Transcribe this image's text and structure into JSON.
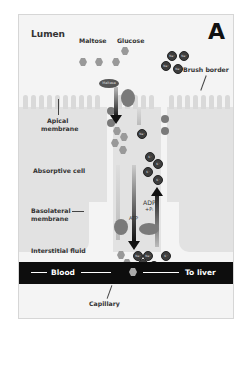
{
  "figure": {
    "panel_letter": "A",
    "labels": {
      "lumen": "Lumen",
      "maltose": "Maltose",
      "glucose": "Glucose",
      "brush_border": "Brush border",
      "apical_membrane_line1": "Apical",
      "apical_membrane_line2": "membrane",
      "absorptive_cell": "Absorptive cell",
      "basolateral_membrane_line1": "Basolateral",
      "basolateral_membrane_line2": "membrane",
      "interstitial_fluid": "Interstitial fluid",
      "capillary": "Capillary",
      "atp": "ATP",
      "adp": "ADP",
      "pi": "+Pᵢ",
      "maltose_enzyme": "Maltase"
    },
    "blood_bar": {
      "left_label": "Blood",
      "right_label": "To liver"
    },
    "ions": {
      "na": "Na⁺",
      "k": "K⁺"
    },
    "colors": {
      "background": "#f4f4f4",
      "cell": "#e2e2e2",
      "blood_bar": "#0d0d0d",
      "ion": "#3d3d3d",
      "glucose": "#999999",
      "arrow": "#111111"
    }
  }
}
